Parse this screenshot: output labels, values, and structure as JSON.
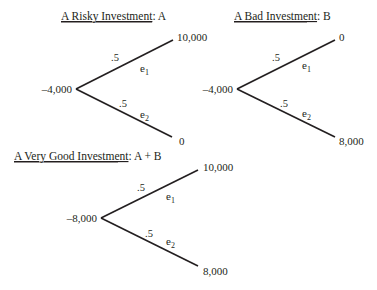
{
  "trees": [
    {
      "id": "A",
      "title_underlined": "A Risky Investment",
      "title_rest": ": A",
      "root_value": "–4,000",
      "branches": [
        {
          "prob": ".5",
          "event": "e",
          "event_sub": "1",
          "payoff": "10,000"
        },
        {
          "prob": ".5",
          "event": "e",
          "event_sub": "2",
          "payoff": "0"
        }
      ]
    },
    {
      "id": "B",
      "title_underlined": "A Bad Investment",
      "title_rest": ": B",
      "root_value": "–4,000",
      "branches": [
        {
          "prob": ".5",
          "event": "e",
          "event_sub": "1",
          "payoff": "0"
        },
        {
          "prob": ".5",
          "event": "e",
          "event_sub": "2",
          "payoff": "8,000"
        }
      ]
    },
    {
      "id": "A+B",
      "title_underlined": "A Very Good Investment",
      "title_rest": ": A + B",
      "root_value": "–8,000",
      "branches": [
        {
          "prob": ".5",
          "event": "e",
          "event_sub": "1",
          "payoff": "10,000"
        },
        {
          "prob": ".5",
          "event": "e",
          "event_sub": "2",
          "payoff": "8,000"
        }
      ]
    }
  ],
  "colors": {
    "ink": "#231f20",
    "background": "#ffffff"
  }
}
